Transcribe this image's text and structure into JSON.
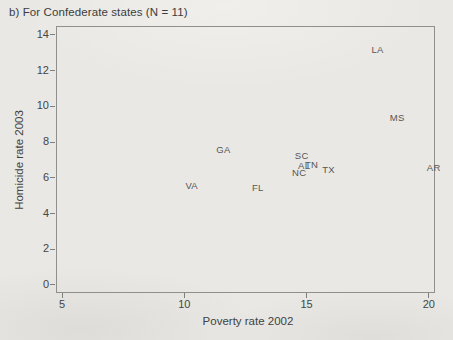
{
  "page": {
    "background_color": "#e9e8e4",
    "text_color": "#3f3f3f",
    "axis_color": "#8f8f8d",
    "marker_text_color": "#565656"
  },
  "chart_data": {
    "type": "scatter",
    "title": "b) For Confederate states (N = 11)",
    "xlabel": "Poverty rate 2002",
    "ylabel": "Homicide rate 2003",
    "xlim": [
      4.75,
      20.25
    ],
    "ylim": [
      -0.45,
      14.5
    ],
    "xticks": [
      5,
      10,
      15,
      20
    ],
    "yticks": [
      0,
      2,
      4,
      6,
      8,
      10,
      12,
      14
    ],
    "grid": false,
    "legend": false,
    "marker": "state-abbreviation-text",
    "points": [
      {
        "label": "LA",
        "x": 17.9,
        "y": 13.2
      },
      {
        "label": "MS",
        "x": 18.7,
        "y": 9.4
      },
      {
        "label": "GA",
        "x": 11.6,
        "y": 7.6
      },
      {
        "label": "SC",
        "x": 14.8,
        "y": 7.3
      },
      {
        "label": "TN",
        "x": 15.2,
        "y": 6.8
      },
      {
        "label": "AL",
        "x": 14.9,
        "y": 6.7
      },
      {
        "label": "NC",
        "x": 14.7,
        "y": 6.3
      },
      {
        "label": "TX",
        "x": 15.9,
        "y": 6.5
      },
      {
        "label": "AR",
        "x": 20.2,
        "y": 6.6
      },
      {
        "label": "VA",
        "x": 10.3,
        "y": 5.6
      },
      {
        "label": "FL",
        "x": 13.0,
        "y": 5.5
      }
    ]
  }
}
